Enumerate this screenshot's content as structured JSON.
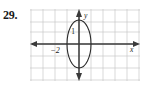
{
  "figure": {
    "problem_number": "29.",
    "width": 148,
    "height": 88
  },
  "axes": {
    "x_label": "x",
    "y_label": "y",
    "x_tick_label": "-2",
    "ellipse_label": "1"
  },
  "colors": {
    "grid": "#c9c9c9",
    "axis": "#3a3a3a",
    "curve": "#2b2b2b",
    "text": "#1a1a1a",
    "background": "#ffffff"
  },
  "chart_data": {
    "type": "scatter",
    "title": "",
    "xlabel": "x",
    "ylabel": "y",
    "xlim": [
      -4,
      5
    ],
    "ylim": [
      -3,
      3
    ],
    "grid": true,
    "legend": null,
    "grid_spacing": {
      "x": 1,
      "y": 1
    },
    "curves": [
      {
        "name": "ellipse",
        "equation": "x^2/1 + y^2/2^2 = 1",
        "center": [
          0,
          0
        ],
        "semi_axis_x": 1,
        "semi_axis_y": 2,
        "orientation": "vertical",
        "x_intercepts": [
          -1,
          1
        ],
        "y_intercepts": [
          -2,
          2
        ]
      }
    ],
    "annotations": [
      {
        "text": "1",
        "x": -0.45,
        "y": 1.05,
        "description": "label inside ellipse near upper-left of y-axis"
      },
      {
        "text": "-2",
        "x": -2.0,
        "y": -0.55,
        "description": "tick label on negative x-axis"
      },
      {
        "text": "y",
        "x": 0.35,
        "y": 2.95,
        "description": "y-axis name at top arrow"
      },
      {
        "text": "x",
        "x": 4.6,
        "y": -0.45,
        "description": "x-axis name at right arrow"
      }
    ]
  }
}
